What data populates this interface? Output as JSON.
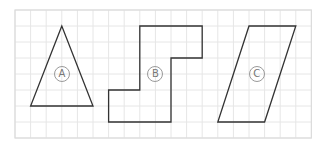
{
  "figure": {
    "grid": {
      "origin_px": [
        15,
        10
      ],
      "cell_w_px": 15.6,
      "cell_h_px": 16,
      "cols": 19,
      "rows": 8,
      "line_color": "#e6e6e6",
      "frame_color": "#dcdcdc"
    },
    "stroke_color": "#333333",
    "shapes": [
      {
        "id": "A",
        "label": "Ⓐ",
        "label_text": "A",
        "type": "triangle",
        "points_grid": [
          [
            3,
            1
          ],
          [
            1,
            6
          ],
          [
            5,
            6
          ]
        ],
        "label_pos_grid": [
          3,
          4
        ]
      },
      {
        "id": "B",
        "label": "Ⓑ",
        "label_text": "B",
        "type": "polygon",
        "points_grid": [
          [
            8,
            1
          ],
          [
            12,
            1
          ],
          [
            12,
            3
          ],
          [
            10,
            3
          ],
          [
            10,
            7
          ],
          [
            6,
            7
          ],
          [
            6,
            5
          ],
          [
            8,
            5
          ]
        ],
        "label_pos_grid": [
          9,
          4
        ]
      },
      {
        "id": "C",
        "label": "Ⓒ",
        "label_text": "C",
        "type": "parallelogram",
        "points_grid": [
          [
            15,
            1
          ],
          [
            18,
            1
          ],
          [
            16,
            7
          ],
          [
            13,
            7
          ]
        ],
        "label_pos_grid": [
          15.5,
          4
        ]
      }
    ]
  }
}
